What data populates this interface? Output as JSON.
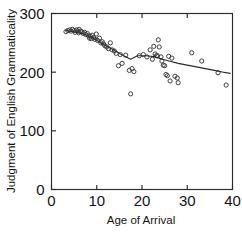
{
  "figure": {
    "background_color": "#ffffff",
    "ink_color": "#2b2b2b",
    "marker_color": "#3a3a3a"
  },
  "chart_data": {
    "type": "scatter",
    "title": "",
    "subtitle": "",
    "xlabel": "Age of Arrival",
    "ylabel": "Judgment of English Grammaticality",
    "xlim": [
      0,
      40
    ],
    "ylim": [
      0,
      300
    ],
    "xticks": [
      0,
      10,
      20,
      30,
      40
    ],
    "yticks": [
      0,
      100,
      200,
      300
    ],
    "xticklabels": [
      "0",
      "10",
      "20",
      "30",
      "40"
    ],
    "yticklabels": [
      "0",
      "100",
      "200",
      "300"
    ],
    "grid": false,
    "legend": null,
    "legend_position": "none",
    "frame": "box",
    "tick_direction": "in",
    "marker_style": "open-circle",
    "points": [
      [
        3.2,
        269
      ],
      [
        3.6,
        271
      ],
      [
        4.0,
        272
      ],
      [
        4.3,
        270
      ],
      [
        4.6,
        273
      ],
      [
        5.0,
        271
      ],
      [
        5.2,
        268
      ],
      [
        5.5,
        272
      ],
      [
        5.8,
        270
      ],
      [
        6.0,
        267
      ],
      [
        6.1,
        273
      ],
      [
        6.4,
        270
      ],
      [
        6.7,
        269
      ],
      [
        7.0,
        266
      ],
      [
        7.3,
        268
      ],
      [
        7.6,
        264
      ],
      [
        7.9,
        266
      ],
      [
        8.2,
        262
      ],
      [
        8.4,
        258
      ],
      [
        8.6,
        261
      ],
      [
        8.8,
        257
      ],
      [
        9.0,
        263
      ],
      [
        9.3,
        259
      ],
      [
        9.6,
        256
      ],
      [
        9.9,
        265
      ],
      [
        10.2,
        254
      ],
      [
        10.6,
        258
      ],
      [
        10.9,
        250
      ],
      [
        11.2,
        252
      ],
      [
        11.5,
        248
      ],
      [
        11.8,
        245
      ],
      [
        12.2,
        243
      ],
      [
        12.6,
        240
      ],
      [
        13.0,
        250
      ],
      [
        13.4,
        238
      ],
      [
        13.9,
        236
      ],
      [
        14.3,
        232
      ],
      [
        14.8,
        211
      ],
      [
        15.2,
        230
      ],
      [
        15.6,
        215
      ],
      [
        16.4,
        229
      ],
      [
        17.2,
        203
      ],
      [
        17.5,
        163
      ],
      [
        17.8,
        206
      ],
      [
        18.2,
        201
      ],
      [
        19.4,
        228
      ],
      [
        20.3,
        230
      ],
      [
        21.1,
        226
      ],
      [
        21.8,
        238
      ],
      [
        22.3,
        222
      ],
      [
        22.6,
        244
      ],
      [
        22.9,
        231
      ],
      [
        23.2,
        228
      ],
      [
        23.4,
        228
      ],
      [
        23.6,
        255
      ],
      [
        23.8,
        243
      ],
      [
        24.2,
        226
      ],
      [
        24.4,
        219
      ],
      [
        24.7,
        212
      ],
      [
        25.0,
        211
      ],
      [
        25.3,
        196
      ],
      [
        25.6,
        194
      ],
      [
        25.9,
        227
      ],
      [
        26.2,
        185
      ],
      [
        26.6,
        224
      ],
      [
        27.3,
        193
      ],
      [
        27.8,
        190
      ],
      [
        28.0,
        182
      ],
      [
        31.0,
        233
      ],
      [
        33.2,
        219
      ],
      [
        36.8,
        199
      ],
      [
        38.6,
        178
      ]
    ],
    "trend_line": {
      "label": "fitted trend",
      "x": [
        3.2,
        5.0,
        7.0,
        9.0,
        10.5,
        12.0,
        13.5,
        15.0,
        16.5,
        17.5,
        19.0,
        21.0,
        23.0,
        24.5,
        26.0,
        28.0,
        30.0,
        32.0,
        34.0,
        36.0,
        38.0,
        39.5
      ],
      "y": [
        271,
        269,
        265,
        259,
        252,
        245,
        239,
        232,
        226,
        222,
        228,
        228,
        226,
        222,
        219,
        215,
        212,
        209,
        206,
        203,
        200,
        198
      ]
    }
  }
}
